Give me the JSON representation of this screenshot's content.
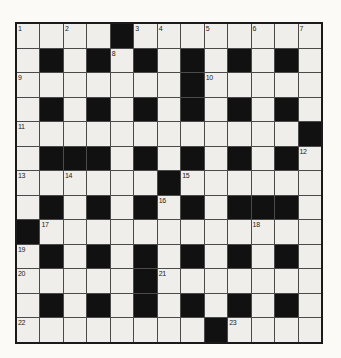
{
  "puzzle": {
    "kind": "crossword",
    "size": {
      "rows": 13,
      "cols": 13
    },
    "rows": [
      "....#........",
      ".#.#.#.#.#.#.",
      ".......#.....",
      ".#.#.#.#.#.#.",
      "............#",
      ".###.#.#.#.#.",
      "......#......",
      ".#.#.#.#.###.",
      "#............",
      ".#.#.#.#.#.#.",
      ".....#.......",
      ".#.#.#.#.#.#.",
      "........#...."
    ],
    "numbers": [
      {
        "num": "1",
        "row": 1,
        "col": 1
      },
      {
        "num": "2",
        "row": 1,
        "col": 3
      },
      {
        "num": "3",
        "row": 1,
        "col": 6
      },
      {
        "num": "4",
        "row": 1,
        "col": 7
      },
      {
        "num": "5",
        "row": 1,
        "col": 9
      },
      {
        "num": "6",
        "row": 1,
        "col": 11
      },
      {
        "num": "7",
        "row": 1,
        "col": 13
      },
      {
        "num": "8",
        "row": 2,
        "col": 5
      },
      {
        "num": "9",
        "row": 3,
        "col": 1
      },
      {
        "num": "10",
        "row": 3,
        "col": 9
      },
      {
        "num": "11",
        "row": 5,
        "col": 1
      },
      {
        "num": "12",
        "row": 6,
        "col": 13
      },
      {
        "num": "13",
        "row": 7,
        "col": 1
      },
      {
        "num": "14",
        "row": 7,
        "col": 3
      },
      {
        "num": "15",
        "row": 7,
        "col": 8
      },
      {
        "num": "16",
        "row": 8,
        "col": 7
      },
      {
        "num": "17",
        "row": 9,
        "col": 2
      },
      {
        "num": "18",
        "row": 9,
        "col": 11
      },
      {
        "num": "19",
        "row": 10,
        "col": 1
      },
      {
        "num": "20",
        "row": 11,
        "col": 1
      },
      {
        "num": "21",
        "row": 11,
        "col": 7
      },
      {
        "num": "22",
        "row": 13,
        "col": 1
      },
      {
        "num": "23",
        "row": 13,
        "col": 10
      }
    ]
  },
  "colors": {
    "page_bg": "#fbfaf7",
    "white_cell": "#f0eeea",
    "black_cell": "#111111",
    "grid_line": "#4a4a4a",
    "outer_border": "#1a1a1a",
    "number_color": "#1b1b1b"
  }
}
